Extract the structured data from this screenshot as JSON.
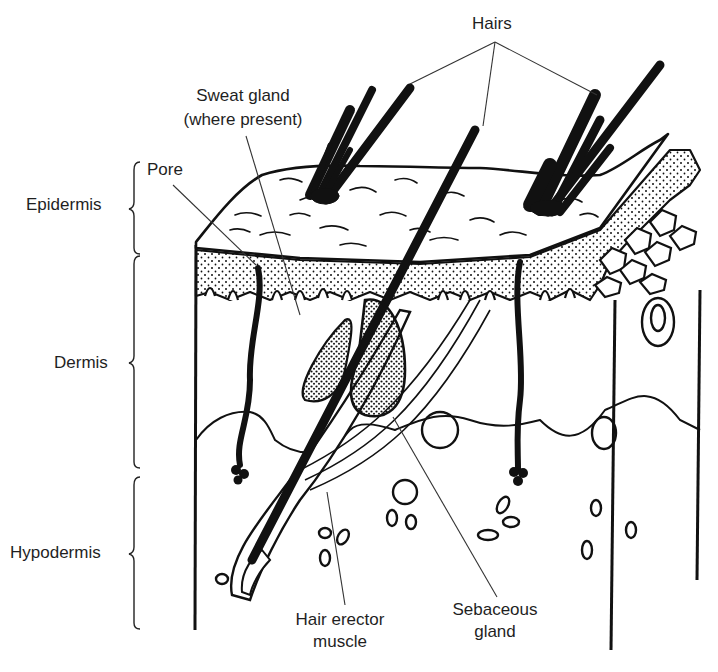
{
  "diagram": {
    "type": "anatomical cross-section of skin",
    "layers": [
      {
        "id": "epidermis",
        "label": "Epidermis"
      },
      {
        "id": "dermis",
        "label": "Dermis"
      },
      {
        "id": "hypodermis",
        "label": "Hypodermis"
      }
    ],
    "callouts": {
      "hairs": "Hairs",
      "sweat_gland_line1": "Sweat gland",
      "sweat_gland_line2": "(where present)",
      "pore": "Pore",
      "hair_erector_line1": "Hair erector",
      "hair_erector_line2": "muscle",
      "sebaceous_line1": "Sebaceous",
      "sebaceous_line2": "gland"
    },
    "colors": {
      "ink": "#111111",
      "leader": "#333333",
      "background": "#ffffff"
    }
  }
}
